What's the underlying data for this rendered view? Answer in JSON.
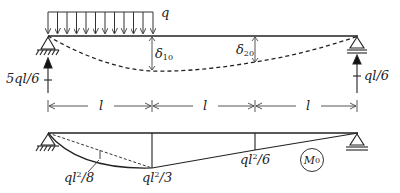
{
  "diagram": {
    "type": "structural-beam",
    "top": {
      "load_label": "q",
      "deflection_labels": [
        {
          "symbol": "δ",
          "sub": "10"
        },
        {
          "symbol": "δ",
          "sub": "20"
        }
      ],
      "reactions": {
        "left": "5ql/6",
        "right": "ql/6"
      },
      "span_labels": [
        "l",
        "l",
        "l"
      ]
    },
    "bottom": {
      "moment_labels": [
        {
          "base": "ql",
          "sup": "2",
          "tail": "/8"
        },
        {
          "base": "ql",
          "sup": "2",
          "tail": "/3"
        },
        {
          "base": "ql",
          "sup": "2",
          "tail": "/6"
        }
      ],
      "diagram_name": {
        "base": "M",
        "sub": "0"
      }
    }
  }
}
